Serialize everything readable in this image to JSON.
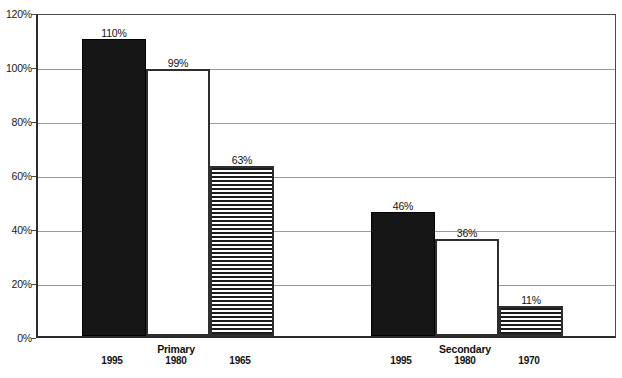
{
  "chart_data": {
    "type": "bar",
    "title": "",
    "subtitle": "",
    "xlabel": "",
    "ylabel": "",
    "ylim": [
      0,
      120
    ],
    "ytick_labels": [
      "0%",
      "20%",
      "40%",
      "60%",
      "80%",
      "100%",
      "120%"
    ],
    "ytick_values": [
      0,
      20,
      40,
      60,
      80,
      100,
      120
    ],
    "grid": true,
    "legend": "none",
    "value_label_format": "percent",
    "groups": [
      {
        "name": "Primary",
        "bars": [
          {
            "category": "1995",
            "value": 110,
            "label": "110%",
            "fill": "solid"
          },
          {
            "category": "1980",
            "value": 99,
            "label": "99%",
            "fill": "open"
          },
          {
            "category": "1965",
            "value": 63,
            "label": "63%",
            "fill": "striped"
          }
        ]
      },
      {
        "name": "Secondary",
        "bars": [
          {
            "category": "1995",
            "value": 46,
            "label": "46%",
            "fill": "solid"
          },
          {
            "category": "1980",
            "value": 36,
            "label": "36%",
            "fill": "open"
          },
          {
            "category": "1970",
            "value": 11,
            "label": "11%",
            "fill": "striped"
          }
        ]
      }
    ],
    "colors": {
      "solid_fill": "#161616",
      "open_fill": "#ffffff",
      "stripe_fill": "#1c1c1c",
      "outline": "#2e2e2e",
      "gridline": "#9a9a9a",
      "axis": "#2b2b2b",
      "text": "#111111",
      "background": "#ffffff"
    }
  }
}
